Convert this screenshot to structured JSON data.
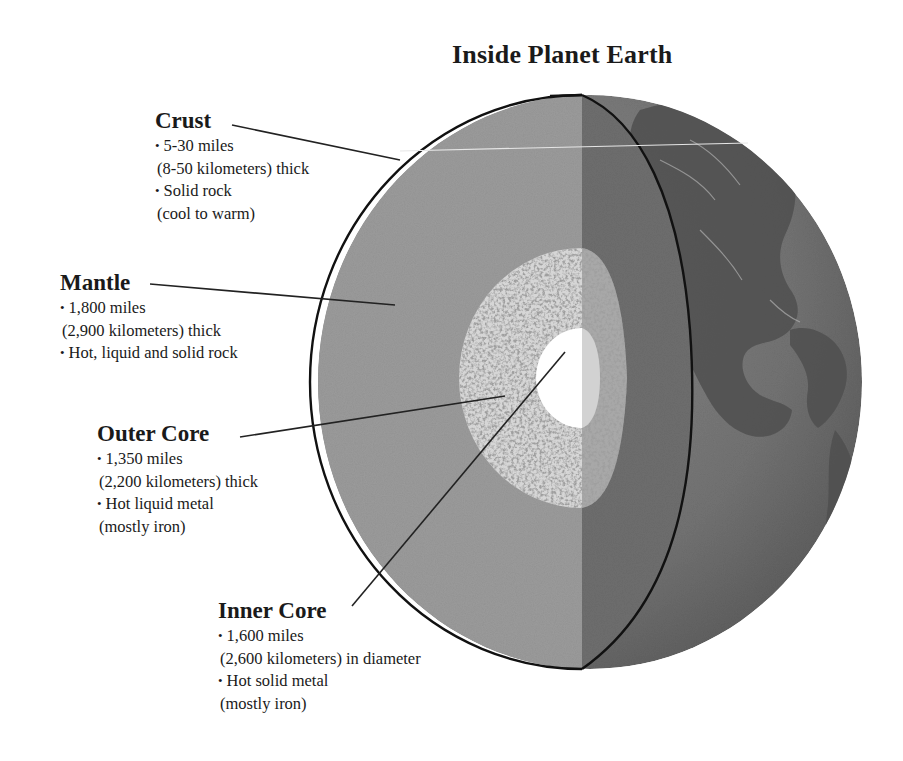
{
  "title": "Inside Planet Earth",
  "colors": {
    "background": "#ffffff",
    "text": "#1a1a1a",
    "cut_face": "#9b9b9b",
    "cut_face_shadow": "#6e6e6e",
    "globe_surface": "#7a7a7a",
    "continents": "#4f4f4f",
    "outer_core": "#d6d6d6",
    "outer_core_speckle": "#8e8e8e",
    "inner_core": "#ffffff",
    "outline": "#111111",
    "leader_line": "#222222"
  },
  "layers": [
    {
      "id": "crust",
      "name": "Crust",
      "lines": [
        {
          "text": "5-30 miles",
          "bullet": true
        },
        {
          "text": "(8-50 kilometers) thick",
          "bullet": false
        },
        {
          "text": "Solid rock",
          "bullet": true
        },
        {
          "text": "(cool to warm)",
          "bullet": false
        }
      ],
      "label_pos": {
        "x": 155,
        "y": 107
      },
      "leader": {
        "x1": 232,
        "y1": 125,
        "x2": 400,
        "y2": 160
      }
    },
    {
      "id": "mantle",
      "name": "Mantle",
      "lines": [
        {
          "text": "1,800 miles",
          "bullet": true
        },
        {
          "text": "(2,900 kilometers) thick",
          "bullet": false
        },
        {
          "text": "Hot, liquid and solid rock",
          "bullet": true
        }
      ],
      "label_pos": {
        "x": 60,
        "y": 269
      },
      "leader": {
        "x1": 150,
        "y1": 284,
        "x2": 395,
        "y2": 305
      }
    },
    {
      "id": "outer-core",
      "name": "Outer Core",
      "lines": [
        {
          "text": "1,350 miles",
          "bullet": true
        },
        {
          "text": "(2,200 kilometers) thick",
          "bullet": false
        },
        {
          "text": "Hot liquid metal",
          "bullet": true
        },
        {
          "text": "(mostly iron)",
          "bullet": false
        }
      ],
      "label_pos": {
        "x": 97,
        "y": 420
      },
      "leader": {
        "x1": 240,
        "y1": 437,
        "x2": 505,
        "y2": 396
      }
    },
    {
      "id": "inner-core",
      "name": "Inner Core",
      "lines": [
        {
          "text": "1,600 miles",
          "bullet": true
        },
        {
          "text": "(2,600 kilometers) in diameter",
          "bullet": false
        },
        {
          "text": "Hot solid metal",
          "bullet": true
        },
        {
          "text": "(mostly iron)",
          "bullet": false
        }
      ],
      "label_pos": {
        "x": 218,
        "y": 597
      },
      "leader": {
        "x1": 352,
        "y1": 606,
        "x2": 565,
        "y2": 352
      }
    }
  ],
  "globe": {
    "cx": 590,
    "cy": 382,
    "rx": 272,
    "ry": 287,
    "cut_x": 582,
    "core_cx": 582,
    "core_cy": 378,
    "outer_core_rx": 123,
    "outer_core_ry": 130,
    "inner_core_rx": 46,
    "inner_core_ry": 50
  }
}
